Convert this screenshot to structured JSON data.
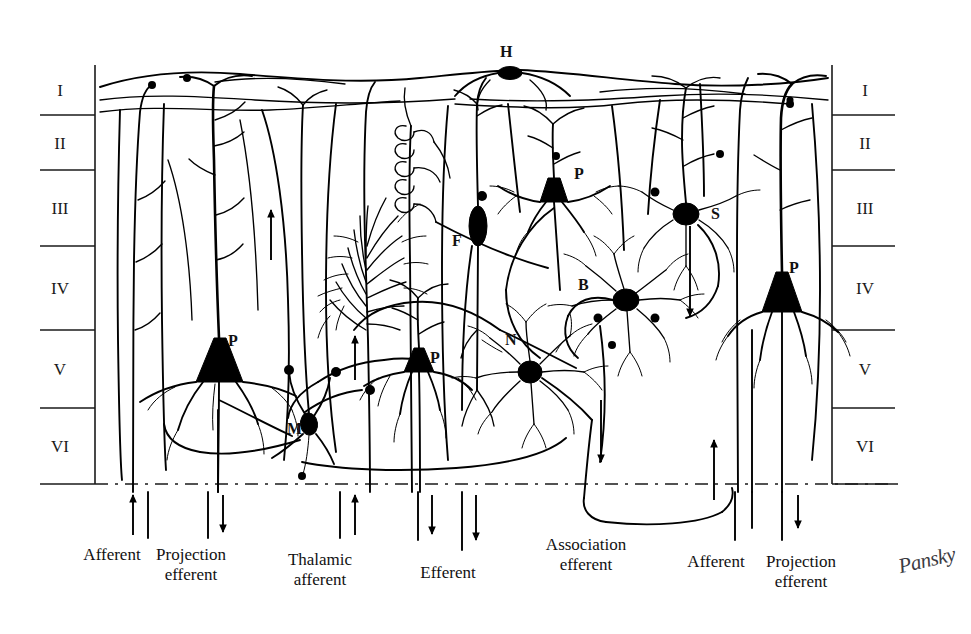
{
  "figure": {
    "type": "neuroanatomy-schematic",
    "background_color": "#ffffff",
    "ink_color": "#000000"
  },
  "layers": {
    "axis_top_y": 65,
    "axis_bottom_y": 484,
    "left_axis_x": 95,
    "right_axis_x": 832,
    "boundaries_y": [
      65,
      115,
      170,
      246,
      330,
      408,
      484
    ],
    "left": [
      {
        "label": "I",
        "y": 90
      },
      {
        "label": "II",
        "y": 143
      },
      {
        "label": "III",
        "y": 208
      },
      {
        "label": "IV",
        "y": 288
      },
      {
        "label": "V",
        "y": 369
      },
      {
        "label": "VI",
        "y": 446
      }
    ],
    "right": [
      {
        "label": "I",
        "y": 90
      },
      {
        "label": "II",
        "y": 143
      },
      {
        "label": "III",
        "y": 208
      },
      {
        "label": "IV",
        "y": 288
      },
      {
        "label": "V",
        "y": 369
      },
      {
        "label": "VI",
        "y": 446
      }
    ]
  },
  "cell_labels": [
    {
      "id": "horizontal-cell",
      "label": "H",
      "x": 500,
      "y": 50
    },
    {
      "id": "pyramidal-cell-upper",
      "label": "P",
      "x": 574,
      "y": 172
    },
    {
      "id": "stellate-cell",
      "label": "S",
      "x": 711,
      "y": 212
    },
    {
      "id": "fusiform-cell",
      "label": "F",
      "x": 452,
      "y": 239
    },
    {
      "id": "basket-cell",
      "label": "B",
      "x": 578,
      "y": 283
    },
    {
      "id": "pyramidal-cell-right",
      "label": "P",
      "x": 789,
      "y": 266
    },
    {
      "id": "pyramidal-cell-large",
      "label": "P",
      "x": 228,
      "y": 339
    },
    {
      "id": "pyramidal-cell-mid",
      "label": "P",
      "x": 430,
      "y": 356
    },
    {
      "id": "neurogliaform-cell",
      "label": "N",
      "x": 508,
      "y": 338
    },
    {
      "id": "martinotti-cell",
      "label": "M",
      "x": 290,
      "y": 428
    }
  ],
  "tract_labels": [
    {
      "id": "afferent-left",
      "lines": [
        "Afferent"
      ],
      "x": 112,
      "y": 551
    },
    {
      "id": "projection-efferent-left",
      "lines": [
        "Projection",
        "efferent"
      ],
      "x": 188,
      "y": 551
    },
    {
      "id": "thalamic-afferent",
      "lines": [
        "Thalamic",
        "afferent"
      ],
      "x": 320,
      "y": 556
    },
    {
      "id": "efferent",
      "lines": [
        "Efferent"
      ],
      "x": 448,
      "y": 569
    },
    {
      "id": "association-efferent",
      "lines": [
        "Association",
        "efferent"
      ],
      "x": 586,
      "y": 541
    },
    {
      "id": "afferent-right",
      "lines": [
        "Afferent"
      ],
      "x": 716,
      "y": 558
    },
    {
      "id": "projection-efferent-right",
      "lines": [
        "Projection",
        "efferent"
      ],
      "x": 799,
      "y": 558
    }
  ],
  "signature": {
    "text": "Pansky",
    "x": 898,
    "y": 558
  }
}
